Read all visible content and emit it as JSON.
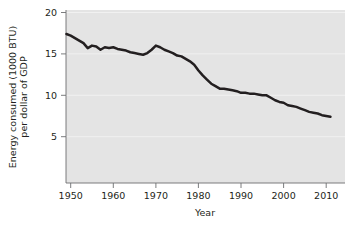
{
  "chart_data": {
    "type": "line",
    "title": "",
    "xlabel": "Year",
    "ylabel": "Energy consumed (1000 BTU)\nper dollar of GDP",
    "ylabel_line1": "Energy consumed (1000 BTU)",
    "ylabel_line2": "per dollar of GDP",
    "xlim": [
      1948,
      2012
    ],
    "ylim": [
      0,
      20
    ],
    "xticks": [
      1950,
      1960,
      1970,
      1980,
      1990,
      2000,
      2010
    ],
    "xtick_labels": [
      "1950",
      "1960",
      "1970",
      "1980",
      "1990",
      "2000",
      "2010"
    ],
    "yticks": [
      5,
      10,
      15,
      20
    ],
    "ytick_labels": [
      "5",
      "10",
      "15",
      "20"
    ],
    "grid": "horizontal-faint",
    "legend": "none",
    "line_color": "#231f20",
    "plot_background": "#e4e4e4",
    "page_background": "#ffffff",
    "series": [
      {
        "name": "Energy intensity",
        "x": [
          1949,
          1950,
          1951,
          1952,
          1953,
          1954,
          1955,
          1956,
          1957,
          1958,
          1959,
          1960,
          1961,
          1962,
          1963,
          1964,
          1965,
          1966,
          1967,
          1968,
          1969,
          1970,
          1971,
          1972,
          1973,
          1974,
          1975,
          1976,
          1977,
          1978,
          1979,
          1980,
          1981,
          1982,
          1983,
          1984,
          1985,
          1986,
          1987,
          1988,
          1989,
          1990,
          1991,
          1992,
          1993,
          1994,
          1995,
          1996,
          1997,
          1998,
          1999,
          2000,
          2001,
          2002,
          2003,
          2004,
          2005,
          2006,
          2007,
          2008,
          2009,
          2010,
          2011
        ],
        "values": [
          17.4,
          17.2,
          16.9,
          16.6,
          16.3,
          15.7,
          16.0,
          15.9,
          15.5,
          15.8,
          15.7,
          15.8,
          15.6,
          15.5,
          15.4,
          15.2,
          15.1,
          15.0,
          14.9,
          15.1,
          15.5,
          16.0,
          15.8,
          15.5,
          15.3,
          15.1,
          14.8,
          14.7,
          14.4,
          14.1,
          13.7,
          13.0,
          12.4,
          11.9,
          11.4,
          11.1,
          10.8,
          10.8,
          10.7,
          10.6,
          10.5,
          10.3,
          10.3,
          10.2,
          10.2,
          10.1,
          10.0,
          10.0,
          9.7,
          9.4,
          9.2,
          9.1,
          8.8,
          8.7,
          8.6,
          8.4,
          8.2,
          8.0,
          7.9,
          7.8,
          7.6,
          7.5,
          7.4
        ]
      }
    ]
  },
  "axes": {
    "y_label_line1": "Energy consumed (1000 BTU)",
    "y_label_line2": "per dollar of GDP",
    "x_label": "Year",
    "x_tick_1": "1950",
    "x_tick_2": "1960",
    "x_tick_3": "1970",
    "x_tick_4": "1980",
    "x_tick_5": "1990",
    "x_tick_6": "2000",
    "x_tick_7": "2010",
    "y_tick_1": "5",
    "y_tick_2": "10",
    "y_tick_3": "15",
    "y_tick_4": "20"
  }
}
